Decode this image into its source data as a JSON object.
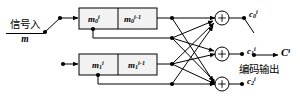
{
  "diagram": {
    "type": "block-diagram",
    "input": {
      "label_cjk": "信号入",
      "label_var": "m",
      "switch": "input-switch"
    },
    "registers": [
      {
        "row": 0,
        "cells": [
          {
            "base": "m",
            "sub": "0",
            "sup": "i"
          },
          {
            "base": "m",
            "sub": "0",
            "sup": "i-1"
          }
        ]
      },
      {
        "row": 1,
        "cells": [
          {
            "base": "m",
            "sub": "1",
            "sup": "i"
          },
          {
            "base": "m",
            "sub": "1",
            "sup": "i-1"
          }
        ]
      }
    ],
    "adders": [
      {
        "id": "adder-0",
        "glyph": "+",
        "output": {
          "base": "c",
          "sub": "0",
          "sup": "i"
        }
      },
      {
        "id": "adder-1",
        "glyph": "+",
        "output": {
          "base": "c",
          "sub": "1",
          "sup": "i"
        }
      },
      {
        "id": "adder-2",
        "glyph": "+",
        "output": {
          "base": "c",
          "sub": "2",
          "sup": "i"
        }
      }
    ],
    "output": {
      "label_var": "C",
      "label_sup": "i",
      "label_cjk": "编码输出"
    },
    "colors": {
      "stroke": "#000000",
      "fill_block": "#f2f2f2",
      "background": "#ffffff"
    }
  }
}
